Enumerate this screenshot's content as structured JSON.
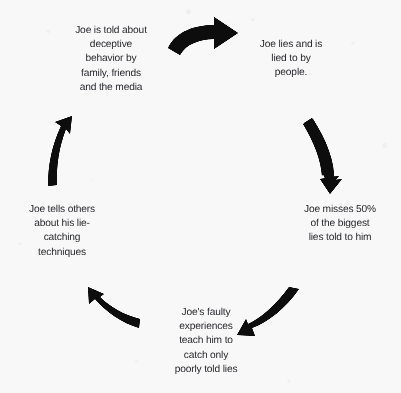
{
  "diagram": {
    "type": "cycle",
    "direction": "clockwise",
    "background_color": "#f8f8f9",
    "ink_color": "#0d0d0f",
    "text_color": "#15161a",
    "nodes": [
      {
        "id": "told-about-deception",
        "position": "top-left",
        "text": "Joe is told about\ndeceptive\nbehavior by\nfamily, friends\nand the media"
      },
      {
        "id": "lies-and-lied-to",
        "position": "top-right",
        "text": "Joe lies and is\nlied to by\npeople."
      },
      {
        "id": "misses-biggest-lies",
        "position": "right",
        "text": "Joe misses 50%\nof the biggest\nlies told to him"
      },
      {
        "id": "faulty-experiences",
        "position": "bottom",
        "text": "Joe's faulty\nexperiences\nteach him to\ncatch only\npoorly told lies"
      },
      {
        "id": "tells-others",
        "position": "left",
        "text": "Joe tells others\nabout his lie-\ncatching\ntechniques"
      }
    ],
    "arrows": [
      {
        "id": "arrow-top",
        "from": "told-about-deception",
        "to": "lies-and-lied-to",
        "direction": "right"
      },
      {
        "id": "arrow-right",
        "from": "lies-and-lied-to",
        "to": "misses-biggest-lies",
        "direction": "down"
      },
      {
        "id": "arrow-bottom-right",
        "from": "misses-biggest-lies",
        "to": "faulty-experiences",
        "direction": "down-left"
      },
      {
        "id": "arrow-bottom-left",
        "from": "faulty-experiences",
        "to": "tells-others",
        "direction": "up-left"
      },
      {
        "id": "arrow-left",
        "from": "tells-others",
        "to": "told-about-deception",
        "direction": "up"
      }
    ]
  }
}
